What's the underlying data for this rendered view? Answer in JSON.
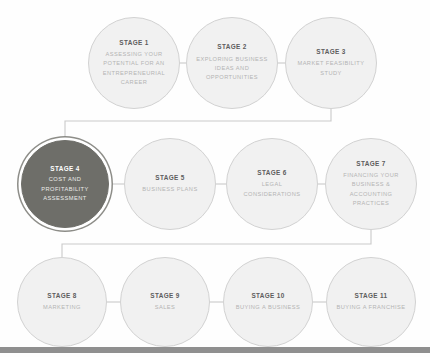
{
  "diagram": {
    "colors": {
      "node_fill": "#f1f1f1",
      "node_border": "#d2d2d2",
      "stage_number_text": "#5d5d5d",
      "stage_title_text": "#b4b4b4",
      "highlight_fill": "#6e6e69",
      "highlight_text": "#ffffff",
      "connector_line": "#c9c9c9",
      "footer_bar": "#8f8f8f"
    },
    "rows": [
      {
        "row_name": "row-1",
        "nodes": [
          {
            "id": "stage-1",
            "number": "STAGE 1",
            "title": "ASSESSING YOUR POTENTIAL FOR AN ENTREPRENEURIAL CAREER",
            "highlighted": false,
            "cx": 134,
            "cy": 63,
            "r": 46
          },
          {
            "id": "stage-2",
            "number": "STAGE 2",
            "title": "EXPLORING BUSINESS IDEAS AND OPPORTUNITIES",
            "highlighted": false,
            "cx": 232,
            "cy": 63,
            "r": 46
          },
          {
            "id": "stage-3",
            "number": "STAGE 3",
            "title": "MARKET FEASIBILITY STUDY",
            "highlighted": false,
            "cx": 331,
            "cy": 63,
            "r": 46
          }
        ]
      },
      {
        "row_name": "row-2",
        "nodes": [
          {
            "id": "stage-4",
            "number": "STAGE 4",
            "title": "COST AND PROFITABILITY ASSESSMENT",
            "highlighted": true,
            "cx": 65,
            "cy": 184,
            "r": 44
          },
          {
            "id": "stage-5",
            "number": "STAGE 5",
            "title": "BUSINESS PLANS",
            "highlighted": false,
            "cx": 170,
            "cy": 184,
            "r": 46
          },
          {
            "id": "stage-6",
            "number": "STAGE 6",
            "title": "LEGAL CONSIDERATIONS",
            "highlighted": false,
            "cx": 272,
            "cy": 184,
            "r": 46
          },
          {
            "id": "stage-7",
            "number": "STAGE 7",
            "title": "FINANCING YOUR BUSINESS & ACCOUNTING PRACTICES",
            "highlighted": false,
            "cx": 371,
            "cy": 184,
            "r": 46
          }
        ]
      },
      {
        "row_name": "row-3",
        "nodes": [
          {
            "id": "stage-8",
            "number": "STAGE 8",
            "title": "MARKETING",
            "highlighted": false,
            "cx": 62,
            "cy": 302,
            "r": 45
          },
          {
            "id": "stage-9",
            "number": "STAGE 9",
            "title": "SALES",
            "highlighted": false,
            "cx": 165,
            "cy": 302,
            "r": 45
          },
          {
            "id": "stage-10",
            "number": "STAGE 10",
            "title": "BUYING A BUSINESS",
            "highlighted": false,
            "cx": 268,
            "cy": 302,
            "r": 45
          },
          {
            "id": "stage-11",
            "number": "STAGE 11",
            "title": "BUYING A FRANCHISE",
            "highlighted": false,
            "cx": 371,
            "cy": 302,
            "r": 45
          }
        ]
      }
    ],
    "connectors": {
      "horizontal": [
        {
          "name": "link-1-2",
          "x1": 180,
          "y1": 63,
          "x2": 186,
          "y2": 63
        },
        {
          "name": "link-2-3",
          "x1": 278,
          "y1": 63,
          "x2": 285,
          "y2": 63
        },
        {
          "name": "link-4-5",
          "x1": 110,
          "y1": 184,
          "x2": 124,
          "y2": 184
        },
        {
          "name": "link-5-6",
          "x1": 216,
          "y1": 184,
          "x2": 226,
          "y2": 184
        },
        {
          "name": "link-6-7",
          "x1": 318,
          "y1": 184,
          "x2": 325,
          "y2": 184
        },
        {
          "name": "link-8-9",
          "x1": 107,
          "y1": 302,
          "x2": 120,
          "y2": 302
        },
        {
          "name": "link-9-10",
          "x1": 210,
          "y1": 302,
          "x2": 223,
          "y2": 302
        },
        {
          "name": "link-10-11",
          "x1": 313,
          "y1": 302,
          "x2": 326,
          "y2": 302
        }
      ],
      "elbows": [
        {
          "name": "link-3-to-4",
          "points": "331,109 331,121 65,121 65,140"
        },
        {
          "name": "link-7-to-8",
          "points": "371,230 371,244 62,244 62,257"
        }
      ]
    },
    "footer": {
      "name": "footer-bar",
      "y": 347,
      "height": 6
    }
  }
}
